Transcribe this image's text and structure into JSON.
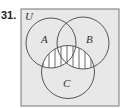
{
  "problem_number": "31.",
  "diagram": {
    "type": "venn",
    "universe_label": "U",
    "sets": [
      {
        "label": "A",
        "cx": 51,
        "cy": 43,
        "r": 25
      },
      {
        "label": "B",
        "cx": 83,
        "cy": 43,
        "r": 26
      },
      {
        "label": "C",
        "cx": 68,
        "cy": 72,
        "r": 26.5
      }
    ],
    "shaded_region": "C ∩ (A ∪ B)",
    "shading_style": "vertical hatching",
    "colors": {
      "background": "#e8e8e8",
      "stroke": "#555555",
      "shading": "#ffffff"
    }
  }
}
